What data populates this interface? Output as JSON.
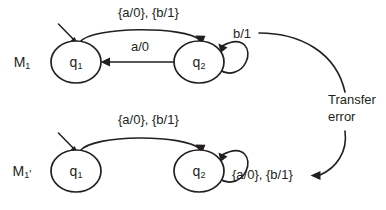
{
  "figure": {
    "ink_color": "#231f20",
    "background_color": "#ffffff"
  },
  "machines": [
    {
      "id": "m1",
      "label_base": "M",
      "label_sub": "1",
      "label_prime": "",
      "states": [
        {
          "id": "q1",
          "base": "q",
          "sub": "1",
          "start": true
        },
        {
          "id": "q2",
          "base": "q",
          "sub": "2",
          "start": false
        }
      ],
      "transitions": [
        {
          "id": "q1-q2",
          "label": "{a/0}, {b/1}",
          "from": "q1",
          "to": "q2"
        },
        {
          "id": "q2-q1",
          "label": "a/0",
          "from": "q2",
          "to": "q1"
        },
        {
          "id": "q2-self",
          "label": "b/1",
          "from": "q2",
          "to": "q2"
        }
      ]
    },
    {
      "id": "m1p",
      "label_base": "M",
      "label_sub": "1",
      "label_prime": "'",
      "states": [
        {
          "id": "q1",
          "base": "q",
          "sub": "1",
          "start": true
        },
        {
          "id": "q2",
          "base": "q",
          "sub": "2",
          "start": false
        }
      ],
      "transitions": [
        {
          "id": "q1-q2",
          "label": "{a/0}, {b/1}",
          "from": "q1",
          "to": "q2"
        },
        {
          "id": "q2-self",
          "label": "{a/0}, {b/1}",
          "from": "q2",
          "to": "q2"
        }
      ]
    }
  ],
  "annotation": {
    "id": "transfer-error",
    "line1": "Transfer",
    "line2": "error"
  }
}
